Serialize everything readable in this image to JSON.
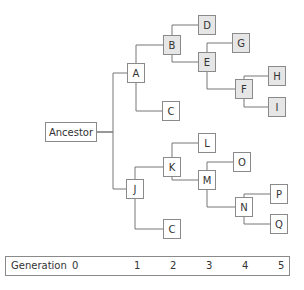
{
  "diagram": {
    "type": "phylogenetic-tree",
    "root": "Ancestor",
    "nodes": [
      {
        "id": "ancestor",
        "label": "Ancestor",
        "x": 45,
        "y": 122,
        "w": 52,
        "h": 20,
        "shaded": false
      },
      {
        "id": "A",
        "label": "A",
        "x": 127,
        "y": 63,
        "w": 18,
        "h": 20,
        "shaded": false
      },
      {
        "id": "B",
        "label": "B",
        "x": 163,
        "y": 35,
        "w": 18,
        "h": 20,
        "shaded": true
      },
      {
        "id": "D",
        "label": "D",
        "x": 198,
        "y": 15,
        "w": 18,
        "h": 20,
        "shaded": true
      },
      {
        "id": "E",
        "label": "E",
        "x": 198,
        "y": 52,
        "w": 18,
        "h": 20,
        "shaded": true
      },
      {
        "id": "G",
        "label": "G",
        "x": 232,
        "y": 33,
        "w": 18,
        "h": 20,
        "shaded": true
      },
      {
        "id": "F",
        "label": "F",
        "x": 235,
        "y": 79,
        "w": 18,
        "h": 20,
        "shaded": true
      },
      {
        "id": "H",
        "label": "H",
        "x": 268,
        "y": 66,
        "w": 18,
        "h": 20,
        "shaded": true
      },
      {
        "id": "I",
        "label": "I",
        "x": 268,
        "y": 97,
        "w": 18,
        "h": 20,
        "shaded": true
      },
      {
        "id": "C1",
        "label": "C",
        "x": 162,
        "y": 101,
        "w": 18,
        "h": 20,
        "shaded": false
      },
      {
        "id": "J",
        "label": "J",
        "x": 126,
        "y": 179,
        "w": 18,
        "h": 20,
        "shaded": false
      },
      {
        "id": "K",
        "label": "K",
        "x": 163,
        "y": 157,
        "w": 18,
        "h": 20,
        "shaded": false
      },
      {
        "id": "L",
        "label": "L",
        "x": 198,
        "y": 133,
        "w": 18,
        "h": 20,
        "shaded": false
      },
      {
        "id": "M",
        "label": "M",
        "x": 198,
        "y": 170,
        "w": 18,
        "h": 20,
        "shaded": false
      },
      {
        "id": "O",
        "label": "O",
        "x": 233,
        "y": 152,
        "w": 18,
        "h": 20,
        "shaded": false
      },
      {
        "id": "N",
        "label": "N",
        "x": 235,
        "y": 197,
        "w": 18,
        "h": 20,
        "shaded": false
      },
      {
        "id": "P",
        "label": "P",
        "x": 270,
        "y": 184,
        "w": 18,
        "h": 20,
        "shaded": false
      },
      {
        "id": "Q",
        "label": "Q",
        "x": 270,
        "y": 214,
        "w": 18,
        "h": 20,
        "shaded": false
      },
      {
        "id": "C2",
        "label": "C",
        "x": 163,
        "y": 219,
        "w": 18,
        "h": 20,
        "shaded": false
      }
    ],
    "edges": [
      [
        "ancestor",
        "A"
      ],
      [
        "ancestor",
        "J"
      ],
      [
        "A",
        "B"
      ],
      [
        "A",
        "C1"
      ],
      [
        "B",
        "D"
      ],
      [
        "B",
        "E"
      ],
      [
        "E",
        "G"
      ],
      [
        "E",
        "F"
      ],
      [
        "F",
        "H"
      ],
      [
        "F",
        "I"
      ],
      [
        "J",
        "K"
      ],
      [
        "J",
        "C2"
      ],
      [
        "K",
        "L"
      ],
      [
        "K",
        "M"
      ],
      [
        "M",
        "O"
      ],
      [
        "M",
        "N"
      ],
      [
        "N",
        "P"
      ],
      [
        "N",
        "Q"
      ]
    ],
    "colors": {
      "line": "#777777",
      "border": "#8a8a8a",
      "shaded_fill": "#e6e6e6",
      "fill": "#ffffff"
    }
  },
  "generation_bar": {
    "title": "Generation",
    "ticks": [
      {
        "label": "0",
        "x": 72
      },
      {
        "label": "1",
        "x": 133
      },
      {
        "label": "2",
        "x": 169
      },
      {
        "label": "3",
        "x": 205
      },
      {
        "label": "4",
        "x": 241
      },
      {
        "label": "5",
        "x": 277
      }
    ]
  }
}
